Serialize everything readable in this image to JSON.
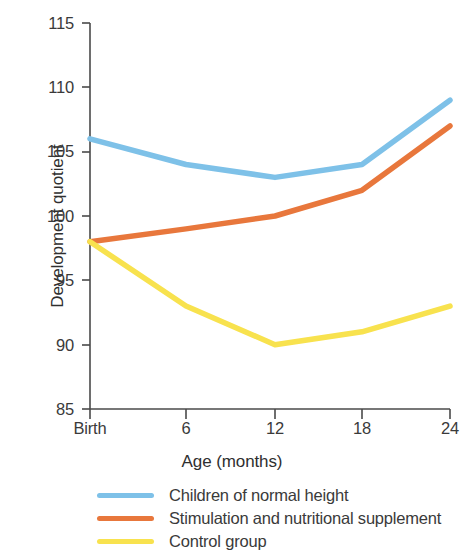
{
  "chart_data": {
    "type": "line",
    "title": "",
    "xlabel": "Age (months)",
    "ylabel": "Development quotient",
    "categories": [
      "Birth",
      "6",
      "12",
      "18",
      "24"
    ],
    "x": [
      0,
      6,
      12,
      18,
      24
    ],
    "ylim": [
      85,
      115
    ],
    "yticks": [
      85,
      90,
      95,
      100,
      105,
      110,
      115
    ],
    "xticks": [
      "Birth",
      "6",
      "12",
      "18",
      "24"
    ],
    "grid": false,
    "legend_position": "bottom",
    "series": [
      {
        "name": "Children of normal height",
        "color": "#7EC1E8",
        "values": [
          106,
          104,
          103,
          104,
          109
        ]
      },
      {
        "name": "Stimulation and nutritional supplement",
        "color": "#E8773C",
        "values": [
          98,
          99,
          100,
          102,
          107
        ]
      },
      {
        "name": "Control group",
        "color": "#F8E24E",
        "values": [
          98,
          93,
          90,
          91,
          93
        ]
      }
    ]
  },
  "axis": {
    "y_tick_labels": [
      "115",
      "110",
      "105",
      "100",
      "95",
      "90",
      "85"
    ],
    "x_tick_labels": [
      "Birth",
      "6",
      "12",
      "18",
      "24"
    ],
    "y_title": "Development quotient",
    "x_title": "Age (months)"
  },
  "legend": {
    "items": [
      {
        "label": "Children of normal height",
        "color": "#7EC1E8"
      },
      {
        "label": "Stimulation and nutritional supplement",
        "color": "#E8773C"
      },
      {
        "label": "Control group",
        "color": "#F8E24E"
      }
    ]
  },
  "colors": {
    "axis": "#4a4a4a",
    "text": "#3a3a3a",
    "background": "#ffffff",
    "series_blue": "#7EC1E8",
    "series_orange": "#E8773C",
    "series_yellow": "#F8E24E"
  }
}
